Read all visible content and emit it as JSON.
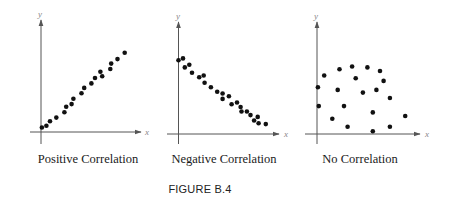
{
  "figure": {
    "label": "FIGURE B.4"
  },
  "panels": [
    {
      "caption": "Positive Correlation",
      "x_axis_label": "x",
      "y_axis_label": "y"
    },
    {
      "caption": "Negative Correlation",
      "x_axis_label": "x",
      "y_axis_label": "y"
    },
    {
      "caption": "No Correlation",
      "x_axis_label": "x",
      "y_axis_label": "y"
    }
  ],
  "colors": {
    "dot": "#111111",
    "axis": "#555555",
    "axis_label": "#888888"
  },
  "chart_data": [
    {
      "type": "scatter",
      "title": "Positive Correlation",
      "xlabel": "x",
      "ylabel": "y",
      "grid": false,
      "points": [
        [
          0.5,
          2.5
        ],
        [
          3,
          3.5
        ],
        [
          5,
          6
        ],
        [
          8.5,
          8
        ],
        [
          13,
          11
        ],
        [
          14,
          14
        ],
        [
          17,
          15.5
        ],
        [
          18,
          18.5
        ],
        [
          22.5,
          21.5
        ],
        [
          24,
          24.5
        ],
        [
          28,
          27
        ],
        [
          30,
          30
        ],
        [
          33,
          33.5
        ],
        [
          34,
          31
        ],
        [
          38.5,
          35
        ],
        [
          39,
          38
        ],
        [
          42.5,
          40.5
        ],
        [
          46.5,
          44
        ]
      ]
    },
    {
      "type": "scatter",
      "title": "Negative Correlation",
      "xlabel": "x",
      "ylabel": "y",
      "grid": false,
      "points": [
        [
          0,
          41
        ],
        [
          2.5,
          42
        ],
        [
          3.5,
          37
        ],
        [
          6,
          38.5
        ],
        [
          7.5,
          34
        ],
        [
          11.5,
          31.5
        ],
        [
          14,
          32.5
        ],
        [
          14.5,
          28.5
        ],
        [
          18,
          26
        ],
        [
          21.5,
          23.5
        ],
        [
          24.5,
          22.5
        ],
        [
          24.5,
          19.5
        ],
        [
          28,
          21
        ],
        [
          29.5,
          16.5
        ],
        [
          32.5,
          17.5
        ],
        [
          34.5,
          15
        ],
        [
          35,
          12.5
        ],
        [
          38,
          12.5
        ],
        [
          40,
          10.5
        ],
        [
          42,
          7.5
        ],
        [
          44,
          9.5
        ],
        [
          44.5,
          6
        ],
        [
          48.5,
          5.5
        ]
      ]
    },
    {
      "type": "scatter",
      "title": "No Correlation",
      "xlabel": "x",
      "ylabel": "y",
      "grid": false,
      "points": [
        [
          0.5,
          26
        ],
        [
          1,
          15.5
        ],
        [
          4,
          32.5
        ],
        [
          8.5,
          8.5
        ],
        [
          11.5,
          24.5
        ],
        [
          12.5,
          36
        ],
        [
          15,
          15.5
        ],
        [
          17,
          4
        ],
        [
          19.5,
          37.5
        ],
        [
          21.5,
          31
        ],
        [
          25.5,
          23
        ],
        [
          28,
          37
        ],
        [
          31,
          12
        ],
        [
          31,
          1.5
        ],
        [
          33,
          24.5
        ],
        [
          35,
          35
        ],
        [
          37,
          29.5
        ],
        [
          40.5,
          20
        ],
        [
          40.5,
          4
        ],
        [
          49,
          10
        ]
      ]
    }
  ]
}
